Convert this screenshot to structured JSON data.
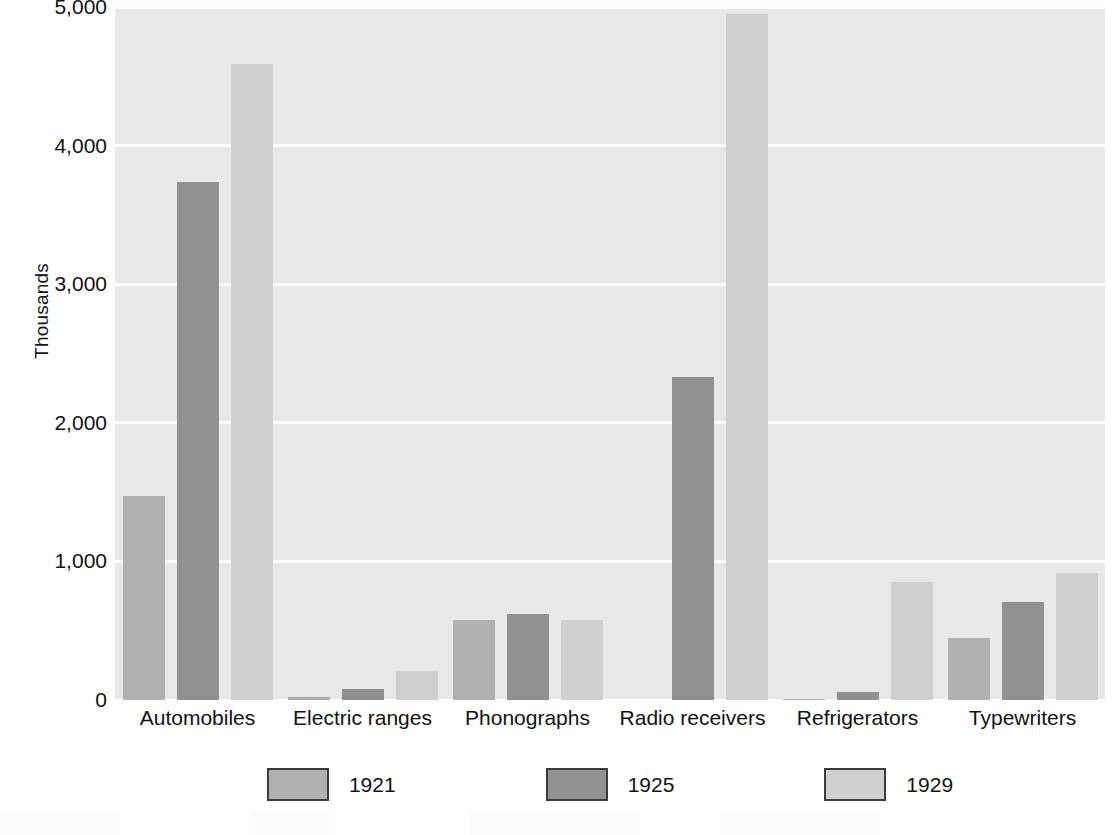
{
  "chart_data": {
    "type": "bar",
    "title": "",
    "subtitle": "",
    "xlabel": "",
    "ylabel": "Thousands",
    "ylim": [
      0,
      5000
    ],
    "yticks": [
      0,
      1000,
      2000,
      3000,
      4000,
      5000
    ],
    "ytick_labels": [
      "0",
      "1,000",
      "2,000",
      "3,000",
      "4,000",
      "5,000"
    ],
    "grid": true,
    "grid_axis": "y",
    "legend_position": "bottom-center",
    "categories": [
      "Automobiles",
      "Electric ranges",
      "Phonographs",
      "Radio receivers",
      "Refrigerators",
      "Typewriters"
    ],
    "series": [
      {
        "name": "1921",
        "color": "#b0b0b0",
        "values": [
          1470,
          20,
          580,
          0,
          5,
          450
        ]
      },
      {
        "name": "1925",
        "color": "#919191",
        "values": [
          3740,
          80,
          620,
          2330,
          60,
          710
        ]
      },
      {
        "name": "1929",
        "color": "#cfcfcf",
        "values": [
          4590,
          210,
          580,
          4950,
          850,
          920
        ]
      }
    ]
  },
  "plot": {
    "background_color": "#e8e8e8",
    "gridline_color": "#fdfdfd"
  }
}
